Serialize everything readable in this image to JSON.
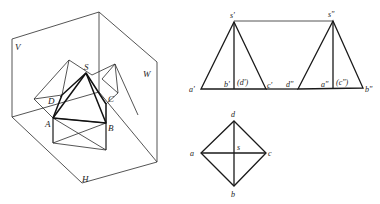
{
  "figure": {
    "pictorial": {
      "planes": {
        "v": "V",
        "w": "W",
        "h": "H"
      },
      "points": {
        "s": "S",
        "a": "A",
        "b": "B",
        "c": "C",
        "d": "D"
      }
    },
    "front_view": {
      "labels": {
        "s": "s'",
        "a": "a'",
        "b": "b'",
        "d": "(d')",
        "c": "c'"
      }
    },
    "side_view": {
      "labels": {
        "s": "s\"",
        "d": "d\"",
        "a": "a\"",
        "c": "(c\")",
        "b": "b\""
      }
    },
    "top_view": {
      "labels": {
        "d": "d",
        "a": "a",
        "s": "s",
        "c": "c",
        "b": "b"
      }
    }
  }
}
